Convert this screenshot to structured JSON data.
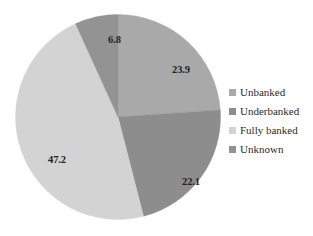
{
  "chart_data": {
    "type": "pie",
    "title": "",
    "subtitle": "",
    "xlabel": "",
    "ylabel": "",
    "grid": false,
    "legend_position": "right",
    "start_angle_deg": 0,
    "direction": "clockwise",
    "categories": [
      "Unbanked",
      "Underbanked",
      "Fully banked",
      "Unknown"
    ],
    "values": [
      23.9,
      22.1,
      47.2,
      6.8
    ],
    "value_labels": [
      "23.9",
      "22.1",
      "47.2",
      "6.8"
    ],
    "colors": [
      "#a9a9a9",
      "#8d8d8d",
      "#d3d3d3",
      "#939393"
    ],
    "slices": [
      {
        "label": "Unbanked",
        "value": 23.9,
        "value_label": "23.9",
        "color": "#a9a9a9",
        "start_deg": 0,
        "end_deg": 86.04
      },
      {
        "label": "Underbanked",
        "value": 22.1,
        "value_label": "22.1",
        "color": "#8d8d8d",
        "start_deg": 86.04,
        "end_deg": 165.6
      },
      {
        "label": "Fully banked",
        "value": 47.2,
        "value_label": "47.2",
        "color": "#d3d3d3",
        "start_deg": 165.6,
        "end_deg": 335.52
      },
      {
        "label": "Unknown",
        "value": 6.8,
        "value_label": "6.8",
        "color": "#939393",
        "start_deg": 335.52,
        "end_deg": 360
      }
    ]
  },
  "legend": {
    "items": [
      {
        "label": "Unbanked",
        "color": "#a9a9a9"
      },
      {
        "label": "Underbanked",
        "color": "#8d8d8d"
      },
      {
        "label": "Fully banked",
        "color": "#d3d3d3"
      },
      {
        "label": "Unknown",
        "color": "#939393"
      }
    ]
  }
}
